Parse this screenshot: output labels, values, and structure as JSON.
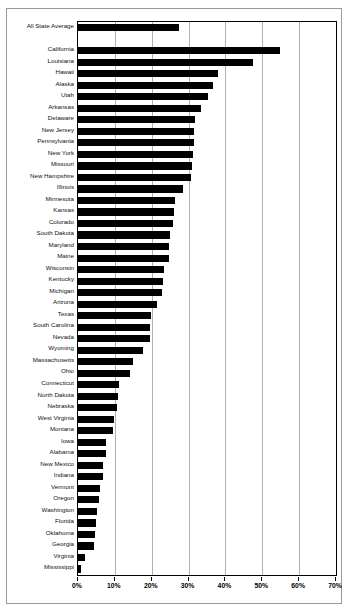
{
  "chart_data": {
    "type": "bar",
    "orientation": "horizontal",
    "title": "",
    "subtitle": "",
    "xlabel": "",
    "ylabel": "",
    "xlim": [
      0,
      70
    ],
    "xunit": "%",
    "xticks": [
      0,
      10,
      20,
      30,
      40,
      50,
      60,
      70
    ],
    "xticklabels": [
      "0%",
      "10%",
      "20%",
      "30%",
      "40%",
      "50%",
      "60%",
      "70%"
    ],
    "grid": true,
    "grid_axis": "x",
    "legend": false,
    "bar_color": "#000000",
    "categories": [
      "All State Average",
      "",
      "California",
      "Louisiana",
      "Hawaii",
      "Alaska",
      "Utah",
      "Arkansas",
      "Delaware",
      "New Jersey",
      "Pennsylvania",
      "New York",
      "Missouri",
      "New Hampshire",
      "Illinois",
      "Minnesota",
      "Kansas",
      "Colorado",
      "South Dakota",
      "Maryland",
      "Maine",
      "Wisconsin",
      "Kentucky",
      "Michigan",
      "Arizona",
      "Texas",
      "South Carolina",
      "Nevada",
      "Wyoming",
      "Massachusetts",
      "Ohio",
      "Connecticut",
      "North Dakota",
      "Nebraska",
      "West Virginia",
      "Montana",
      "Iowa",
      "Alabama",
      "New Mexico",
      "Indiana",
      "Vermont",
      "Oregon",
      "Washington",
      "Florida",
      "Oklahoma",
      "Georgia",
      "Virginia",
      "Mississippi"
    ],
    "values": [
      27.3,
      null,
      54.8,
      47.5,
      38.0,
      36.7,
      35.4,
      33.3,
      31.8,
      31.6,
      31.4,
      31.2,
      31.0,
      30.6,
      28.6,
      26.2,
      26.0,
      25.9,
      25.0,
      24.8,
      24.6,
      23.3,
      23.1,
      22.9,
      21.5,
      19.8,
      19.6,
      19.4,
      17.6,
      14.8,
      14.0,
      11.0,
      10.8,
      10.6,
      9.8,
      9.6,
      7.7,
      7.5,
      6.8,
      6.7,
      5.9,
      5.8,
      5.1,
      5.0,
      4.5,
      4.4,
      2.0,
      0.8
    ]
  }
}
